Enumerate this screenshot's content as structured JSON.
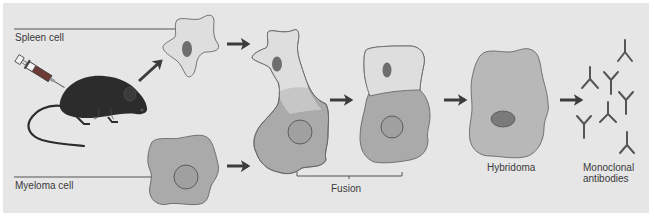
{
  "diagram": {
    "labels": {
      "spleen_cell": "Spleen cell",
      "myeloma_cell": "Myeloma cell",
      "fusion": "Fusion",
      "hybridoma": "Hybridoma",
      "monoclonal_line1": "Monoclonal",
      "monoclonal_line2": "antibodies"
    },
    "colors": {
      "background": "#e6e6e6",
      "spleen_cytoplasm": "#dedede",
      "myeloma_cytoplasm": "#aaaaaa",
      "fusion_zone": "#c6c6c6",
      "hybridoma_cytoplasm": "#b8b8b8",
      "nucleus_dark": "#6e6e6e",
      "nucleus_myeloma": "#9e9e9e",
      "outline": "#666666",
      "arrow": "#3c3c3c",
      "mouse": "#2c2c2c",
      "antibody": "#555555"
    },
    "steps": [
      "Immunized mouse",
      "Spleen cell + Myeloma cell",
      "Fusion",
      "Hybridoma",
      "Monoclonal antibodies"
    ],
    "antibody_count": 8
  }
}
